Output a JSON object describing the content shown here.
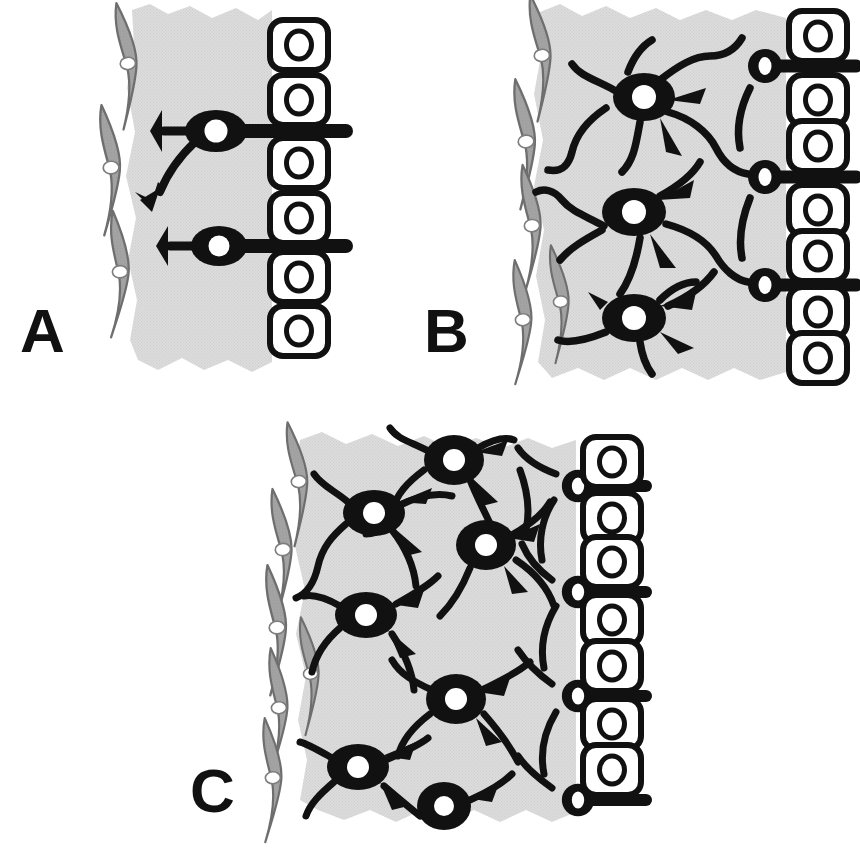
{
  "figure": {
    "background_color": "#ffffff",
    "palette": {
      "tissue_gray": "#dcdcdc",
      "glial_gray": "#a3a3a3",
      "glial_outline": "#6e6e6e",
      "neuron_black": "#111111",
      "nucleus_white": "#ffffff",
      "epithelium_fill": "#ffffff",
      "epithelium_stroke": "#111111",
      "label_color": "#111111"
    }
  },
  "panels": [
    {
      "id": "A",
      "label": "A",
      "label_x": 20,
      "label_y": 352,
      "stage_description": "sparse innervation: two bipolar neurons with trumpet-shaped dendrites contacting the epithelium",
      "region": {
        "x": 80,
        "y": 0,
        "width": 275,
        "height": 380
      },
      "tissue": {
        "x": 112,
        "y": 8,
        "width": 160,
        "height": 360
      },
      "glial_cells": [
        {
          "cx": 118,
          "cy": 66,
          "angle": -6
        },
        {
          "cx": 104,
          "cy": 168,
          "angle": -4
        },
        {
          "cx": 112,
          "cy": 272,
          "angle": -2
        }
      ],
      "neurons": [
        {
          "type": "bipolar",
          "cx": 216,
          "cy": 131,
          "soma_rx": 30,
          "soma_ry": 20,
          "nucleus_r": 11,
          "axon": {
            "to_x": 348,
            "width": 13
          },
          "dendrites": [
            "trumpet-left-horizontal",
            "trumpet-down-left-curved"
          ]
        },
        {
          "type": "bipolar",
          "cx": 219,
          "cy": 246,
          "soma_rx": 27,
          "soma_ry": 19,
          "nucleus_r": 10,
          "axon": {
            "to_x": 348,
            "width": 13
          },
          "dendrites": [
            "trumpet-left-horizontal"
          ]
        }
      ],
      "epithelial_cells": [
        {
          "cx": 299,
          "cy": 45
        },
        {
          "cx": 299,
          "cy": 100
        },
        {
          "cx": 299,
          "cy": 163
        },
        {
          "cx": 299,
          "cy": 218
        },
        {
          "cx": 299,
          "cy": 277
        },
        {
          "cx": 299,
          "cy": 331
        }
      ],
      "counts": {
        "neurons": 2,
        "glial_cells": 3,
        "epithelial_cells": 6
      }
    },
    {
      "id": "B",
      "label": "B",
      "label_x": 424,
      "label_y": 352,
      "stage_description": "intermediate innervation: three multipolar neurons plus three small epithelium-contacting neurons with a developing plexus",
      "region": {
        "x": 470,
        "y": 0,
        "width": 390,
        "height": 390
      },
      "tissue": {
        "x": 512,
        "y": 8,
        "width": 275,
        "height": 370
      },
      "glial_cells": [
        {
          "cx": 530,
          "cy": 55,
          "angle": -6
        },
        {
          "cx": 516,
          "cy": 140,
          "angle": -5
        },
        {
          "cx": 522,
          "cy": 224,
          "angle": -4
        },
        {
          "cx": 550,
          "cy": 300,
          "angle": -4
        },
        {
          "cx": 514,
          "cy": 318,
          "angle": -3
        }
      ],
      "neurons": [
        {
          "type": "multipolar",
          "cx": 644,
          "cy": 97,
          "soma_rx": 30,
          "soma_ry": 23,
          "nucleus_r": 12
        },
        {
          "type": "multipolar",
          "cx": 634,
          "cy": 212,
          "soma_rx": 31,
          "soma_ry": 23,
          "nucleus_r": 12
        },
        {
          "type": "multipolar",
          "cx": 634,
          "cy": 318,
          "soma_rx": 31,
          "soma_ry": 23,
          "nucleus_r": 12
        },
        {
          "type": "terminal",
          "cx": 765,
          "cy": 66,
          "soma_r": 17,
          "nucleus_r": 7,
          "axon_to_x": 855
        },
        {
          "type": "terminal",
          "cx": 765,
          "cy": 177,
          "soma_r": 17,
          "nucleus_r": 7,
          "axon_to_x": 855
        },
        {
          "type": "terminal",
          "cx": 765,
          "cy": 285,
          "soma_r": 17,
          "nucleus_r": 7,
          "axon_to_x": 855
        }
      ],
      "epithelial_cells": [
        {
          "cx": 818,
          "cy": 36
        },
        {
          "cx": 818,
          "cy": 100
        },
        {
          "cx": 818,
          "cy": 146
        },
        {
          "cx": 818,
          "cy": 210
        },
        {
          "cx": 818,
          "cy": 256
        },
        {
          "cx": 818,
          "cy": 312
        },
        {
          "cx": 818,
          "cy": 358
        }
      ],
      "counts": {
        "neurons": 6,
        "glial_cells": 5,
        "epithelial_cells": 7
      }
    },
    {
      "id": "C",
      "label": "C",
      "label_x": 190,
      "label_y": 812,
      "stage_description": "mature dense plexus: many multipolar neurons with extensive interconnected processes and multiple epithelial contacts",
      "region": {
        "x": 210,
        "y": 420,
        "width": 440,
        "height": 425
      },
      "tissue": {
        "x": 272,
        "y": 432,
        "width": 305,
        "height": 390
      },
      "glial_cells": [
        {
          "cx": 288,
          "cy": 480,
          "angle": -6
        },
        {
          "cx": 272,
          "cy": 548,
          "angle": -5
        },
        {
          "cx": 266,
          "cy": 626,
          "angle": -4
        },
        {
          "cx": 300,
          "cy": 672,
          "angle": -4
        },
        {
          "cx": 268,
          "cy": 706,
          "angle": -3
        },
        {
          "cx": 262,
          "cy": 776,
          "angle": -3
        }
      ],
      "neurons": [
        {
          "type": "multipolar",
          "cx": 454,
          "cy": 460,
          "soma_rx": 29,
          "soma_ry": 24,
          "nucleus_r": 11
        },
        {
          "type": "multipolar",
          "cx": 374,
          "cy": 513,
          "soma_rx": 30,
          "soma_ry": 22,
          "nucleus_r": 11
        },
        {
          "type": "multipolar",
          "cx": 486,
          "cy": 545,
          "soma_rx": 29,
          "soma_ry": 24,
          "nucleus_r": 11
        },
        {
          "type": "multipolar",
          "cx": 366,
          "cy": 615,
          "soma_rx": 30,
          "soma_ry": 22,
          "nucleus_r": 11
        },
        {
          "type": "multipolar",
          "cx": 456,
          "cy": 699,
          "soma_rx": 29,
          "soma_ry": 24,
          "nucleus_r": 11
        },
        {
          "type": "multipolar",
          "cx": 358,
          "cy": 767,
          "soma_rx": 30,
          "soma_ry": 22,
          "nucleus_r": 11
        },
        {
          "type": "multipolar",
          "cx": 444,
          "cy": 806,
          "soma_rx": 26,
          "soma_ry": 23,
          "nucleus_r": 10
        },
        {
          "type": "terminal",
          "cx": 578,
          "cy": 486,
          "soma_r": 16,
          "nucleus_r": 7,
          "axon_to_x": 645
        },
        {
          "type": "terminal",
          "cx": 578,
          "cy": 592,
          "soma_r": 16,
          "nucleus_r": 7,
          "axon_to_x": 645
        },
        {
          "type": "terminal",
          "cx": 578,
          "cy": 696,
          "soma_r": 16,
          "nucleus_r": 7,
          "axon_to_x": 645
        },
        {
          "type": "terminal",
          "cx": 578,
          "cy": 800,
          "soma_r": 16,
          "nucleus_r": 7,
          "axon_to_x": 645
        }
      ],
      "epithelial_cells": [
        {
          "cx": 612,
          "cy": 462
        },
        {
          "cx": 612,
          "cy": 518
        },
        {
          "cx": 612,
          "cy": 562
        },
        {
          "cx": 612,
          "cy": 620
        },
        {
          "cx": 612,
          "cy": 666
        },
        {
          "cx": 612,
          "cy": 724
        },
        {
          "cx": 612,
          "cy": 770
        }
      ],
      "counts": {
        "neurons": 11,
        "glial_cells": 6,
        "epithelial_cells": 7
      }
    }
  ],
  "legend_keys": {
    "neuron": "black soma with white nucleus",
    "glial_cell": "gray spindle-shaped cell with white nucleus",
    "epithelial_cell": "white rounded rectangle with ring nucleus",
    "tissue": "light gray torn-edge tissue field"
  }
}
